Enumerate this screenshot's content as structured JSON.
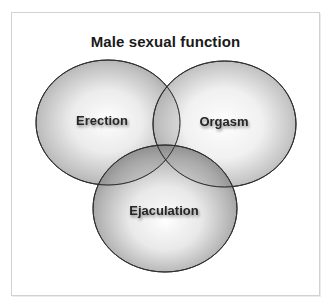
{
  "diagram": {
    "title": "Male sexual function",
    "type": "venn",
    "sets": [
      {
        "id": "erection",
        "label": "Erection",
        "cx": 108,
        "cy": 122.5,
        "rx": 72,
        "ry": 62.5
      },
      {
        "id": "orgasm",
        "label": "Orgasm",
        "cx": 224.5,
        "cy": 124,
        "rx": 71.5,
        "ry": 63
      },
      {
        "id": "ejaculation",
        "label": "Ejaculation",
        "cx": 165,
        "cy": 208.5,
        "rx": 72,
        "ry": 63.5
      }
    ],
    "colors": {
      "outline": "#2e2e2e",
      "fill_center": "#ffffff",
      "fill_edge": "#8c8c8c",
      "frame_border": "#d2d2d2",
      "text": "#262626"
    }
  }
}
